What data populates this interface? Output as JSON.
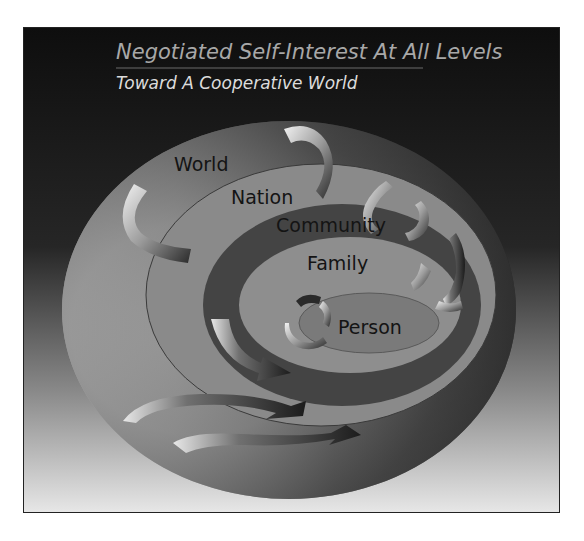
{
  "diagram": {
    "title": "Negotiated Self-Interest At All Levels",
    "subtitle": "Toward A Cooperative World",
    "levels": [
      {
        "label": "World"
      },
      {
        "label": "Nation"
      },
      {
        "label": "Community"
      },
      {
        "label": "Family"
      },
      {
        "label": "Person"
      }
    ],
    "colors": {
      "background_top": "#111111",
      "background_bottom": "#e6e6e6",
      "title": "#a8a8a8",
      "subtitle": "#dcdcdc",
      "label": "#141414"
    }
  }
}
